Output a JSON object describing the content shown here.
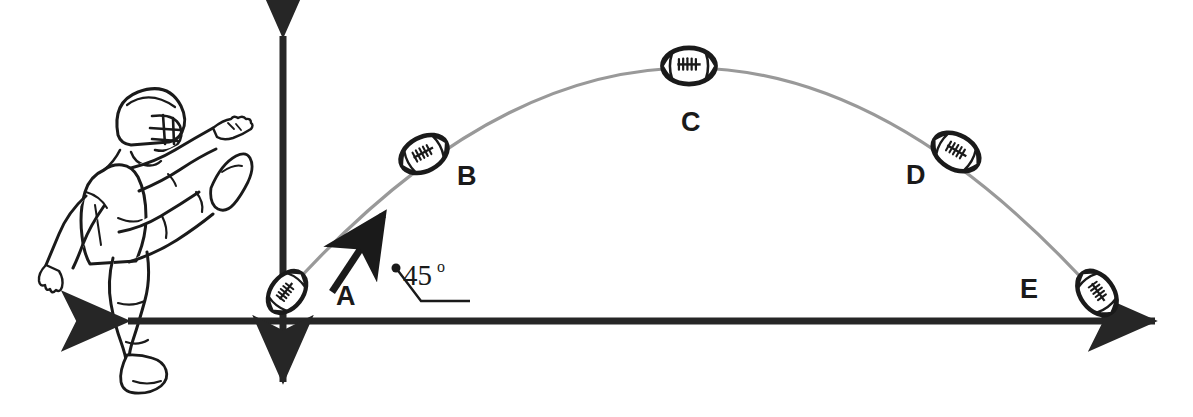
{
  "figure": {
    "background_color": "#ffffff",
    "ink_color": "#1a1a1a",
    "trajectory_color": "#999999",
    "axis_color": "#262626"
  },
  "axes": {
    "origin": {
      "x": 283,
      "y": 321
    },
    "horizontal": {
      "name": "x-axis",
      "x1": 118,
      "y1": 321,
      "x2": 1165,
      "y2": 321,
      "arrowheads": "both"
    },
    "vertical": {
      "name": "y-axis",
      "x1": 283,
      "y1": 25,
      "x2": 283,
      "y2": 392,
      "arrowheads": "both"
    }
  },
  "trajectory": {
    "type": "parabola",
    "start": {
      "x": 287,
      "y": 292
    },
    "apex": {
      "x": 690,
      "y": 67
    },
    "end": {
      "x": 1098,
      "y": 296
    },
    "stroke_width": 3
  },
  "launch": {
    "angle_text": "45",
    "degree_symbol": "o",
    "angle_value_degrees": 45,
    "velocity_arrow": {
      "x1": 332,
      "y1": 292,
      "x2": 385,
      "y2": 212
    },
    "leader_dot": {
      "x": 396,
      "y": 268
    },
    "leader_line": [
      {
        "x": 396,
        "y": 268
      },
      {
        "x": 421,
        "y": 301
      },
      {
        "x": 470,
        "y": 301
      }
    ]
  },
  "ball_positions": [
    {
      "id": "A",
      "label": "A",
      "ball": {
        "cx": 287,
        "cy": 292,
        "rx": 23,
        "ry": 16,
        "rotation": -52
      },
      "label_pos": {
        "x": 336,
        "y": 305
      },
      "phase": "launch"
    },
    {
      "id": "B",
      "label": "B",
      "ball": {
        "cx": 424,
        "cy": 154,
        "rx": 25,
        "ry": 17,
        "rotation": -28
      },
      "label_pos": {
        "x": 457,
        "y": 185
      },
      "phase": "rising"
    },
    {
      "id": "C",
      "label": "C",
      "ball": {
        "cx": 689,
        "cy": 66,
        "rx": 26,
        "ry": 19,
        "rotation": 0
      },
      "label_pos": {
        "x": 681,
        "y": 131
      },
      "phase": "apex"
    },
    {
      "id": "D",
      "label": "D",
      "ball": {
        "cx": 956,
        "cy": 152,
        "rx": 25,
        "ry": 17,
        "rotation": 30
      },
      "label_pos": {
        "x": 906,
        "y": 184
      },
      "phase": "falling"
    },
    {
      "id": "E",
      "label": "E",
      "ball": {
        "cx": 1097,
        "cy": 293,
        "rx": 24,
        "ry": 17,
        "rotation": 54
      },
      "label_pos": {
        "x": 1020,
        "y": 298
      },
      "phase": "landing"
    }
  ],
  "player": {
    "name": "football-kicker",
    "description": "American football punter illustration in follow-through kicking pose",
    "equipment": [
      "helmet",
      "facemask",
      "jersey",
      "pants",
      "cleats"
    ]
  }
}
